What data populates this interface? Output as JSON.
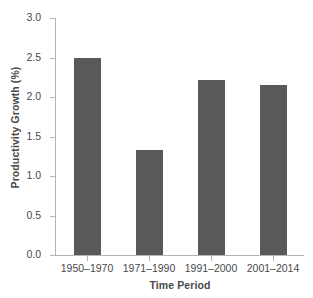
{
  "chart_data": {
    "type": "bar",
    "title": "",
    "categories": [
      "1950–1970",
      "1971–1990",
      "1991–2000",
      "2001–2014"
    ],
    "values": [
      2.5,
      1.33,
      2.21,
      2.15
    ],
    "xlabel": "Time Period",
    "ylabel": "Productivity Growth (%)",
    "ylim": [
      0.0,
      3.0
    ],
    "yticks": [
      "0.0",
      "0.5",
      "1.0",
      "1.5",
      "2.0",
      "2.5",
      "3.0"
    ],
    "ytick_values": [
      0.0,
      0.5,
      1.0,
      1.5,
      2.0,
      2.5,
      3.0
    ],
    "grid": false,
    "legend": "none",
    "bar_color": "#595959",
    "axis_color": "#b4b4b4",
    "background": "#ffffff"
  }
}
